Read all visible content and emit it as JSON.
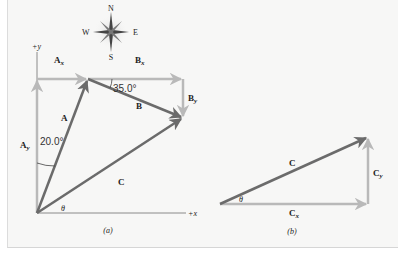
{
  "figure": {
    "compass": {
      "north": "N",
      "south": "S",
      "east": "E",
      "west": "W"
    },
    "panel_a": {
      "caption": "(a)",
      "axis_x_label": "+x",
      "axis_y_label": "+y",
      "vectors": {
        "A": {
          "label": "A",
          "angle_from_y_deg": 20.0,
          "angle_label": "20.0°"
        },
        "B": {
          "label": "B",
          "angle_below_x_deg": 35.0,
          "angle_label": "35.0°"
        },
        "C": {
          "label": "C"
        },
        "Ax": {
          "label": "A",
          "sub": "x"
        },
        "Ay": {
          "label": "A",
          "sub": "y"
        },
        "Bx": {
          "label": "B",
          "sub": "x"
        },
        "By": {
          "label": "B",
          "sub": "y"
        }
      },
      "theta_label": "θ"
    },
    "panel_b": {
      "caption": "(b)",
      "vectors": {
        "C": {
          "label": "C"
        },
        "Cx": {
          "label": "C",
          "sub": "x"
        },
        "Cy": {
          "label": "C",
          "sub": "y"
        }
      },
      "theta_label": "θ"
    },
    "colors": {
      "resultant": "#6b6b6b",
      "component": "#b9b9b9",
      "axis": "#8a8a8a",
      "background": "#f7f7f6"
    }
  }
}
